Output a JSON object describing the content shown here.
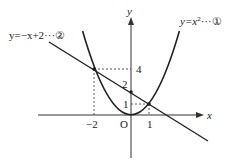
{
  "diagram": {
    "type": "function-graph",
    "curves": [
      {
        "id": "parabola",
        "equation_label": "y=x²···①",
        "prefix": "y=x",
        "sup": "2",
        "suffix": "···①"
      },
      {
        "id": "line",
        "equation_label": "y=−x+2···②",
        "text": "y=−x+2···②"
      }
    ],
    "axes": {
      "x_label": "x",
      "y_label": "y",
      "origin_label": "O"
    },
    "ticks": {
      "x": [
        "−2",
        "1"
      ],
      "y": [
        "4",
        "2",
        "1"
      ]
    },
    "intersections": [
      {
        "x": -2,
        "y": 4
      },
      {
        "x": 1,
        "y": 1
      }
    ],
    "y_intercept": {
      "x": 0,
      "y": 2
    }
  }
}
